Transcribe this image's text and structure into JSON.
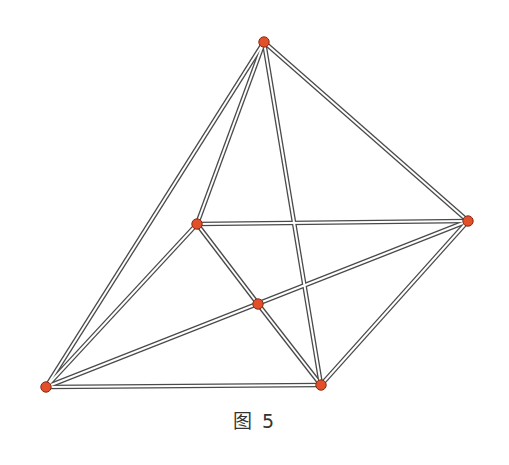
{
  "caption": "图 5",
  "colors": {
    "edge_outer": "#4a4a4a",
    "edge_inner": "#ffffff",
    "node_fill": "#e2502a",
    "node_stroke": "#8a2a14"
  },
  "nodes": [
    {
      "id": "T",
      "x": 264,
      "y": 42
    },
    {
      "id": "R",
      "x": 468,
      "y": 221
    },
    {
      "id": "M",
      "x": 197,
      "y": 224
    },
    {
      "id": "C",
      "x": 258,
      "y": 304
    },
    {
      "id": "A",
      "x": 46,
      "y": 387
    },
    {
      "id": "B",
      "x": 321,
      "y": 385
    }
  ],
  "edges": [
    [
      "T",
      "A"
    ],
    [
      "T",
      "M"
    ],
    [
      "T",
      "B"
    ],
    [
      "T",
      "R"
    ],
    [
      "M",
      "R"
    ],
    [
      "M",
      "A"
    ],
    [
      "M",
      "C"
    ],
    [
      "C",
      "B"
    ],
    [
      "A",
      "B"
    ],
    [
      "A",
      "R"
    ],
    [
      "B",
      "R"
    ]
  ]
}
